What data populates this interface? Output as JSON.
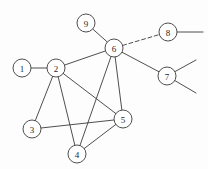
{
  "figure": {
    "width": 208,
    "height": 169,
    "background_color": "#fdfdfd",
    "stroke_color": "#3b3b3b",
    "node_fill_color": "#ffffff",
    "label_color": "#1f1f1f"
  },
  "graph_data": {
    "type": "node-link-diagram",
    "directed": false,
    "node_radius": 9,
    "nodes": [
      {
        "id": "1",
        "label": "1",
        "x": 22,
        "y": 68
      },
      {
        "id": "2",
        "label": "2",
        "x": 56,
        "y": 68
      },
      {
        "id": "3",
        "label": "3",
        "x": 32,
        "y": 129
      },
      {
        "id": "4",
        "label": "4",
        "x": 77,
        "y": 154
      },
      {
        "id": "5",
        "label": "5",
        "x": 123,
        "y": 119
      },
      {
        "id": "6",
        "label": "6",
        "x": 114,
        "y": 48
      },
      {
        "id": "7",
        "label": "7",
        "x": 167,
        "y": 76
      },
      {
        "id": "8",
        "label": "8",
        "x": 168,
        "y": 32
      },
      {
        "id": "9",
        "label": "9",
        "x": 86,
        "y": 23
      }
    ],
    "edges": [
      {
        "source": "1",
        "target": "2",
        "style": "solid"
      },
      {
        "source": "2",
        "target": "3",
        "style": "solid"
      },
      {
        "source": "2",
        "target": "4",
        "style": "solid"
      },
      {
        "source": "2",
        "target": "5",
        "style": "solid"
      },
      {
        "source": "2",
        "target": "6",
        "style": "solid"
      },
      {
        "source": "3",
        "target": "5",
        "style": "solid"
      },
      {
        "source": "4",
        "target": "5",
        "style": "solid"
      },
      {
        "source": "4",
        "target": "6",
        "style": "solid"
      },
      {
        "source": "5",
        "target": "6",
        "style": "solid"
      },
      {
        "source": "6",
        "target": "9",
        "style": "solid"
      },
      {
        "source": "6",
        "target": "7",
        "style": "solid"
      },
      {
        "source": "6",
        "target": "8",
        "style": "dashed"
      }
    ],
    "stubs": [
      {
        "from": "8",
        "to_x": 203,
        "to_y": 32
      },
      {
        "from": "7",
        "to_x": 196,
        "to_y": 60
      },
      {
        "from": "7",
        "to_x": 196,
        "to_y": 93
      }
    ]
  }
}
